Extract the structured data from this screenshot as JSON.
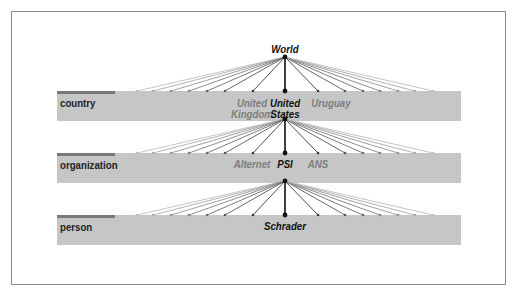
{
  "diagram": {
    "root": {
      "label": "World"
    },
    "levels": [
      {
        "name": "country",
        "top": 91,
        "hub_y": 119,
        "labels": [
          {
            "text": "United\nKingdom",
            "x": 252,
            "y": 98,
            "style": "muted",
            "lines": [
              "United",
              "Kingdom"
            ]
          },
          {
            "text": "United\nStates",
            "x": 285,
            "y": 98,
            "style": "dark",
            "lines": [
              "United",
              "States"
            ]
          },
          {
            "text": "Uruguay",
            "x": 331,
            "y": 98,
            "style": "muted",
            "lines": [
              "Uruguay"
            ]
          }
        ]
      },
      {
        "name": "organization",
        "top": 153,
        "hub_y": 181,
        "labels": [
          {
            "x": 252,
            "y": 159,
            "style": "muted",
            "lines": [
              "Alternet"
            ]
          },
          {
            "x": 285,
            "y": 159,
            "style": "dark",
            "lines": [
              "PSI"
            ]
          },
          {
            "x": 318,
            "y": 159,
            "style": "muted",
            "lines": [
              "ANS"
            ]
          }
        ]
      },
      {
        "name": "person",
        "top": 215,
        "hub_y": null,
        "labels": [
          {
            "x": 285,
            "y": 221,
            "style": "dark",
            "lines": [
              "Schrader"
            ]
          }
        ]
      }
    ],
    "child_x": [
      137,
      153,
      171,
      189,
      207,
      225,
      253,
      285,
      318,
      345,
      363,
      380,
      398,
      415,
      433
    ],
    "hubs": [
      {
        "x": 285,
        "y": 57
      },
      {
        "x": 285,
        "y": 119
      },
      {
        "x": 285,
        "y": 181
      }
    ],
    "colors": {
      "band": "#c6c6c6",
      "strip": "#787878",
      "line_dark": "#111111",
      "line_light": "#bdbdbd"
    }
  }
}
